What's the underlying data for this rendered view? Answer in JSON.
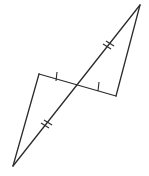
{
  "diagram": {
    "line_color": "#2b2b2b",
    "background": "#ffffff",
    "marks": {
      "diagonal_segments": "double tick (congruent halves of long diagonal)",
      "horizontal_segments": "single tick (congruent halves of short segment)"
    }
  }
}
